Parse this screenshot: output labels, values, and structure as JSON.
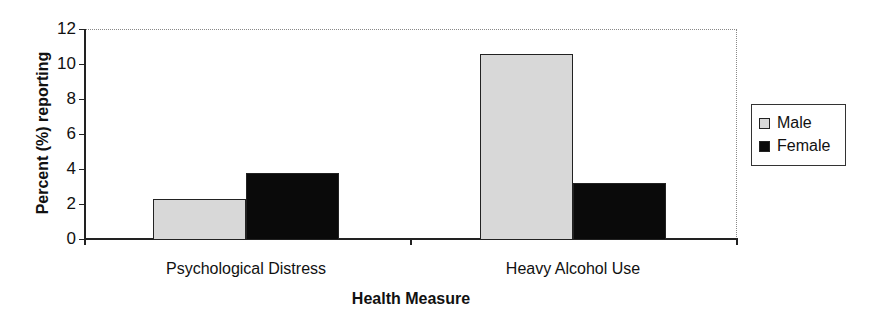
{
  "chart_data": {
    "type": "bar",
    "title": "",
    "xlabel": "Health Measure",
    "ylabel": "Percent (%) reporting",
    "categories": [
      "Psychological Distress",
      "Heavy Alcohol Use"
    ],
    "series": [
      {
        "name": "Male",
        "color": "#d8d8d8",
        "values": [
          2.3,
          10.6
        ]
      },
      {
        "name": "Female",
        "color": "#0a0a0a",
        "values": [
          3.8,
          3.2
        ]
      }
    ],
    "ylim": [
      0,
      12
    ],
    "yticks": [
      "0",
      "2",
      "4",
      "6",
      "8",
      "10",
      "12"
    ],
    "grid": false,
    "legend_position": "right"
  }
}
